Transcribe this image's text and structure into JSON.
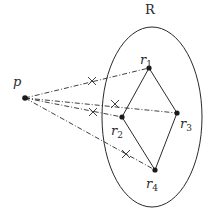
{
  "region": {
    "label": "R",
    "ellipse": {
      "cx": 152,
      "cy": 117,
      "rx": 50,
      "ry": 90
    },
    "label_pos": {
      "x": 150,
      "y": 14
    }
  },
  "source_point": {
    "label": "p",
    "x": 25,
    "y": 98,
    "label_pos": {
      "x": 13,
      "y": 86
    }
  },
  "points": [
    {
      "id": "r1",
      "base": "r",
      "sub": "1",
      "x": 149,
      "y": 68,
      "label_pos": {
        "x": 140,
        "y": 64
      }
    },
    {
      "id": "r2",
      "base": "r",
      "sub": "2",
      "x": 122,
      "y": 117,
      "label_pos": {
        "x": 111,
        "y": 135
      }
    },
    {
      "id": "r3",
      "base": "r",
      "sub": "3",
      "x": 177,
      "y": 113,
      "label_pos": {
        "x": 180,
        "y": 128
      }
    },
    {
      "id": "r4",
      "base": "r",
      "sub": "4",
      "x": 155,
      "y": 170,
      "label_pos": {
        "x": 146,
        "y": 188
      }
    }
  ],
  "polygon_edges": [
    [
      "r1",
      "r3"
    ],
    [
      "r3",
      "r4"
    ],
    [
      "r4",
      "r2"
    ],
    [
      "r2",
      "r1"
    ]
  ],
  "rays": [
    {
      "to": "r1",
      "cross": {
        "x": 92,
        "y": 81
      }
    },
    {
      "to": "r3",
      "cross": {
        "x": 115,
        "y": 104
      }
    },
    {
      "to": "r2",
      "cross": {
        "x": 93,
        "y": 112
      }
    },
    {
      "to": "r4",
      "cross": {
        "x": 126,
        "y": 154
      }
    }
  ],
  "colors": {
    "stroke": "#2a2a2a",
    "background": "#ffffff"
  }
}
